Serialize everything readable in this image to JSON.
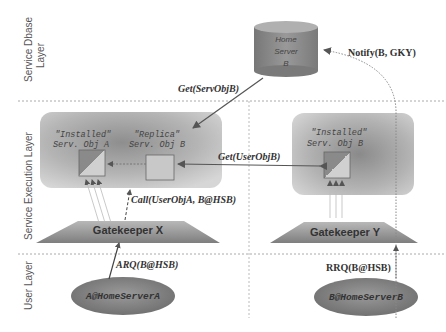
{
  "layers": {
    "dbase_line1": "Service Dbase",
    "dbase_line2": "Layer",
    "execution": "Service Execution Layer",
    "user": "User Layer"
  },
  "home_server": {
    "line1": "Home",
    "line2": "Server",
    "line3": "B"
  },
  "service_domain_x": {
    "installed_label": "\"Installed\"",
    "installed_obj": "Serv. Obj A",
    "replica_label": "\"Replica\"",
    "replica_obj": "Serv. Obj B"
  },
  "service_domain_y": {
    "installed_label": "\"Installed\"",
    "installed_obj": "Serv. Obj B"
  },
  "gatekeepers": {
    "x": "Gatekeeper X",
    "y": "Gatekeeper Y"
  },
  "users": {
    "a": "A@HomeServerA",
    "b": "B@HomeServerB"
  },
  "messages": {
    "get_serv_obj": "Get(ServObjB)",
    "notify": "Notify(B, GKY)",
    "get_user_obj": "Get(UserObjB)",
    "call": "Call(UserObjA, B@HSB)",
    "arq": "ARQ(B@HSB)",
    "rrq": "RRQ(B@HSB)"
  },
  "colors": {
    "cylinder": "#8a8a8a",
    "panel": "#b8b8b8",
    "gatekeeper": "#8c8c8c",
    "user_ellipse": "#7a7a7a",
    "arrow": "#555555"
  }
}
